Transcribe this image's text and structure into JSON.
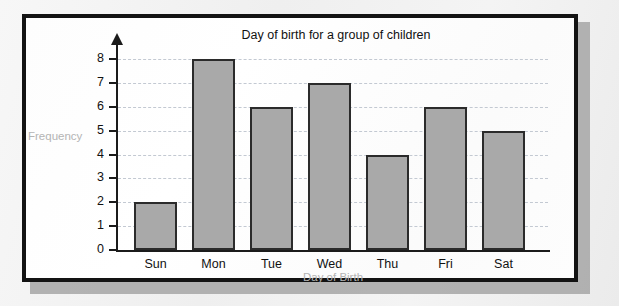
{
  "chart_data": {
    "type": "bar",
    "title": "Day of birth for a group of children",
    "xlabel": "Day of Birth",
    "ylabel": "Frequency",
    "categories": [
      "Sun",
      "Mon",
      "Tue",
      "Wed",
      "Thu",
      "Fri",
      "Sat"
    ],
    "values": [
      2,
      8,
      6,
      7,
      4,
      6,
      5
    ],
    "ylim": [
      0,
      8
    ],
    "ytick_labels": [
      "0",
      "1",
      "2",
      "3",
      "4",
      "5",
      "6",
      "7",
      "8"
    ],
    "ytick_values": [
      0,
      1,
      2,
      3,
      4,
      5,
      6,
      7,
      8
    ],
    "grid": "horizontal-dashed",
    "legend": "none",
    "colors": {
      "bar_fill": "#a9a9a9",
      "bar_stroke": "#2b2b2b",
      "axis": "#1b1b1b",
      "gridline": "#c3c9d2",
      "title_text": "#111111",
      "axis_title_text": "#b4b4b4",
      "frame": "#131313",
      "page_background": "#f2f2f2",
      "plot_background": "#ffffff",
      "shadow": "#a6a6a6"
    }
  }
}
